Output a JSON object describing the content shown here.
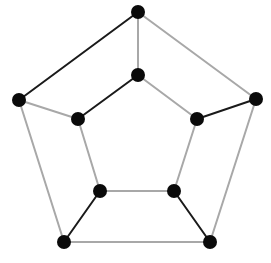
{
  "diagram": {
    "type": "graph",
    "colors": {
      "node": "#0a0a0a",
      "edge_dark": "#1a1a1a",
      "edge_light": "#a8a8a8",
      "background": "#ffffff"
    },
    "node_radius": 7,
    "nodes": [
      {
        "id": "outer_top",
        "x": 138,
        "y": 12
      },
      {
        "id": "outer_left",
        "x": 19,
        "y": 100
      },
      {
        "id": "outer_right",
        "x": 256,
        "y": 99
      },
      {
        "id": "outer_bottom_left",
        "x": 64,
        "y": 242
      },
      {
        "id": "outer_bottom_right",
        "x": 210,
        "y": 242
      },
      {
        "id": "inner_top",
        "x": 138,
        "y": 75
      },
      {
        "id": "inner_left",
        "x": 78,
        "y": 119
      },
      {
        "id": "inner_right",
        "x": 197,
        "y": 119
      },
      {
        "id": "inner_bottom_left",
        "x": 100,
        "y": 191
      },
      {
        "id": "inner_bottom_right",
        "x": 174,
        "y": 191
      }
    ],
    "edges": [
      {
        "from": "outer_top",
        "to": "outer_left",
        "style": "dark"
      },
      {
        "from": "outer_top",
        "to": "outer_right",
        "style": "light"
      },
      {
        "from": "outer_top",
        "to": "inner_top",
        "style": "light"
      },
      {
        "from": "outer_left",
        "to": "inner_left",
        "style": "light"
      },
      {
        "from": "outer_left",
        "to": "outer_bottom_left",
        "style": "light"
      },
      {
        "from": "outer_right",
        "to": "inner_right",
        "style": "dark"
      },
      {
        "from": "outer_right",
        "to": "outer_bottom_right",
        "style": "light"
      },
      {
        "from": "inner_top",
        "to": "inner_left",
        "style": "dark"
      },
      {
        "from": "inner_top",
        "to": "inner_right",
        "style": "light"
      },
      {
        "from": "inner_left",
        "to": "inner_bottom_left",
        "style": "light"
      },
      {
        "from": "inner_right",
        "to": "inner_bottom_right",
        "style": "light"
      },
      {
        "from": "inner_bottom_left",
        "to": "inner_bottom_right",
        "style": "light"
      },
      {
        "from": "inner_bottom_left",
        "to": "outer_bottom_left",
        "style": "dark"
      },
      {
        "from": "inner_bottom_right",
        "to": "outer_bottom_right",
        "style": "dark"
      },
      {
        "from": "outer_bottom_left",
        "to": "outer_bottom_right",
        "style": "light"
      }
    ]
  }
}
